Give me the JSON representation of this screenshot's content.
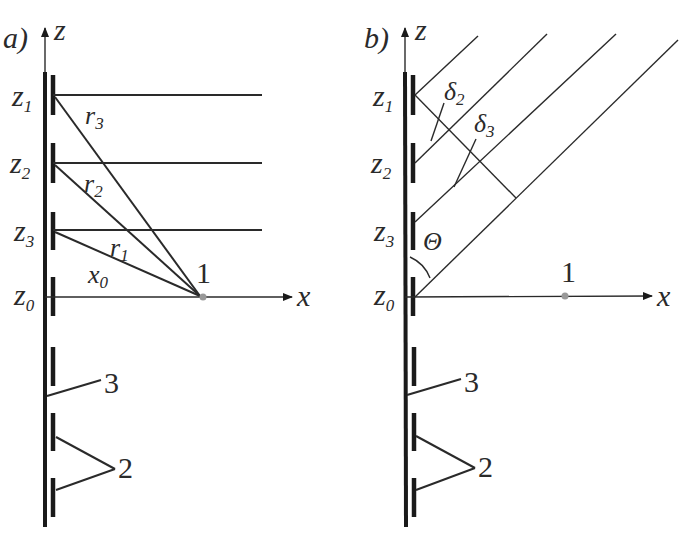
{
  "figure": {
    "panel_a": {
      "label": "a)",
      "z_axis": "z",
      "x_axis": "x",
      "z_levels": [
        {
          "name": "z",
          "sub": "1"
        },
        {
          "name": "z",
          "sub": "2"
        },
        {
          "name": "z",
          "sub": "3"
        },
        {
          "name": "z",
          "sub": "0"
        }
      ],
      "distances": [
        {
          "name": "r",
          "sub": "3"
        },
        {
          "name": "r",
          "sub": "2"
        },
        {
          "name": "r",
          "sub": "1"
        },
        {
          "name": "x",
          "sub": "0"
        }
      ],
      "point_label": "1",
      "callouts": [
        "3",
        "2"
      ]
    },
    "panel_b": {
      "label": "b)",
      "z_axis": "z",
      "x_axis": "x",
      "z_levels": [
        {
          "name": "z",
          "sub": "1"
        },
        {
          "name": "z",
          "sub": "2"
        },
        {
          "name": "z",
          "sub": "3"
        },
        {
          "name": "z",
          "sub": "0"
        }
      ],
      "path_differences": [
        {
          "name": "δ",
          "sub": "2"
        },
        {
          "name": "δ",
          "sub": "3"
        }
      ],
      "angle": "Θ",
      "point_label": "1",
      "callouts": [
        "3",
        "2"
      ]
    },
    "colors": {
      "line": "#1a1a1a",
      "point": "#999999",
      "background": "#ffffff"
    }
  }
}
